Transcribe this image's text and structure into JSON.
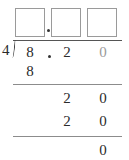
{
  "problem": {
    "divisor": "4",
    "dividend": {
      "ones": "8",
      "decimal_point": ".",
      "tenths": "2",
      "hundredths": "0"
    },
    "quotient_boxes": [
      {
        "value": "",
        "position": "ones"
      },
      {
        "value": "",
        "position": "tenths"
      },
      {
        "value": "",
        "position": "hundredths"
      }
    ],
    "quotient_decimal_point": "."
  },
  "steps": [
    {
      "row": 1,
      "digits": {
        "ones": "8"
      }
    },
    {
      "row": 2,
      "digits": {
        "tenths": "2",
        "hundredths": "0"
      }
    },
    {
      "row": 3,
      "digits": {
        "tenths": "2",
        "hundredths": "0"
      }
    },
    {
      "row": 4,
      "digits": {
        "hundredths": "0"
      }
    }
  ],
  "colors": {
    "text": "#2a2a2a",
    "placeholder_zero": "#9a9a9a",
    "lines": "#8c8c8c",
    "box_border": "#9a9a9a"
  }
}
